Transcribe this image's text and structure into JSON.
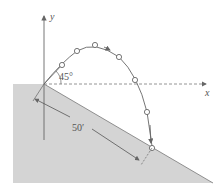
{
  "figure": {
    "type": "projectile-on-incline",
    "labels": {
      "y_axis": "y",
      "x_axis": "x",
      "launch_angle": "45°",
      "distance": "50′"
    },
    "colors": {
      "ground_fill": "#d4d4d4",
      "line": "#666666",
      "marker_fill": "#ffffff"
    },
    "trajectory_points": [
      [
        62,
        65
      ],
      [
        77,
        51
      ],
      [
        95,
        45
      ],
      [
        119,
        57
      ],
      [
        135,
        80
      ],
      [
        147,
        112
      ],
      [
        152,
        148
      ]
    ]
  }
}
